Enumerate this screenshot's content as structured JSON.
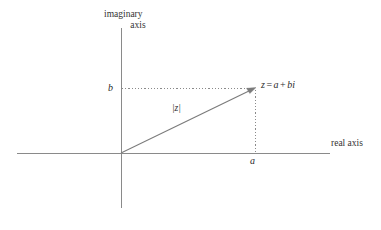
{
  "diagram": {
    "type": "complex-plane-argand-diagram",
    "background_color": "#ffffff",
    "axis_color": "#8a8a8a",
    "vector_color": "#7b7b7b",
    "dotted_color": "#8a8a8a",
    "text_color": "#2b2b2b",
    "labels": {
      "imaginary_axis_line1": "imaginary",
      "imaginary_axis_line2": "axis",
      "real_axis": "real axis",
      "b": "b",
      "a": "a",
      "modulus": "|z|",
      "point_z_var": "z",
      "point_z_eq": "=",
      "point_z_a": "a",
      "point_z_plus": "+",
      "point_z_bi": "bi"
    },
    "geometry": {
      "origin": {
        "x": 121,
        "y": 153
      },
      "point_z": {
        "x": 255,
        "y": 88
      },
      "real_axis": {
        "x1": 17,
        "y1": 153,
        "x2": 330,
        "y2": 153
      },
      "imaginary_axis": {
        "x1": 121,
        "y1": 28,
        "x2": 121,
        "y2": 208
      },
      "dotted_horizontal": {
        "x1": 122,
        "y1": 88,
        "x2": 254,
        "y2": 88
      },
      "dotted_vertical": {
        "x1": 255,
        "y1": 89,
        "x2": 255,
        "y2": 152
      }
    }
  }
}
